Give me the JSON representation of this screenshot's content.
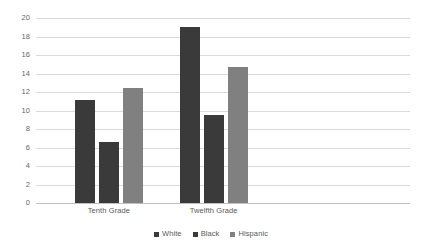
{
  "chart_data": {
    "type": "bar",
    "title": "",
    "subtitle": "",
    "xlabel": "",
    "ylabel": "",
    "categories": [
      "Tenth Grade",
      "Twelfth Grade"
    ],
    "series": [
      {
        "name": "White",
        "values": [
          11.1,
          19.0
        ],
        "color": "#3a3a3a"
      },
      {
        "name": "Black",
        "values": [
          6.6,
          9.5
        ],
        "color": "#3a3a3a"
      },
      {
        "name": "Hispanic",
        "values": [
          12.4,
          14.7
        ],
        "color": "#808080"
      }
    ],
    "ylim": [
      0,
      20
    ],
    "ytick_step": 2,
    "ytick_labels": [
      "0",
      "2",
      "4",
      "6",
      "8",
      "10",
      "12",
      "14",
      "16",
      "18",
      "20"
    ],
    "grid": true,
    "grid_color": "#d9d9d9",
    "legend_position": "bottom",
    "plot_background": "#ffffff",
    "axis_text_color": "#595959"
  }
}
